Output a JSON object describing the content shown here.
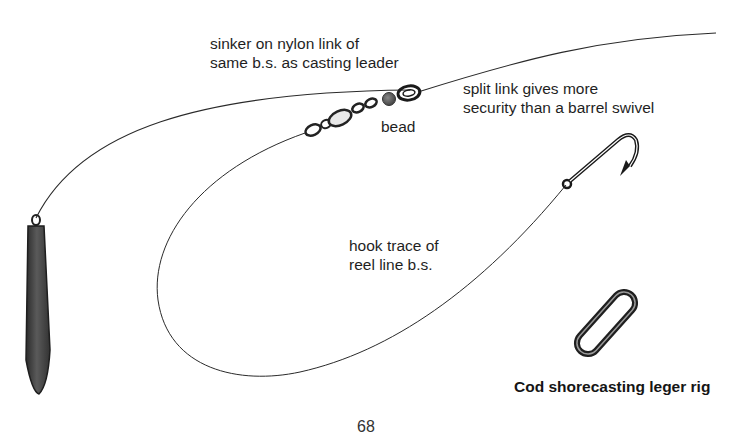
{
  "diagram": {
    "title": "Cod shorecasting leger rig",
    "labels": {
      "sinker_link_line1": "sinker on nylon link of",
      "sinker_link_line2": "same b.s. as casting leader",
      "bead": "bead",
      "split_link_line1": "split link gives more",
      "split_link_line2": "security than a barrel swivel",
      "hook_trace_line1": "hook trace of",
      "hook_trace_line2": "reel line b.s."
    },
    "page_number": "68",
    "components": [
      "sinker",
      "nylon-link-line",
      "swivel",
      "bead",
      "split-ring",
      "main-line",
      "hook-trace",
      "hook",
      "split-link"
    ],
    "colors": {
      "line": "#2a2a2a",
      "sinker": "#4a4a4a",
      "ink": "#1a1a1a"
    }
  }
}
